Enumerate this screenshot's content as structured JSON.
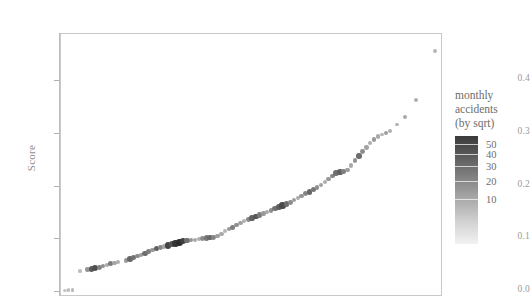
{
  "chart_data": {
    "type": "scatter",
    "title": "",
    "xlabel": "",
    "ylabel": "Score",
    "xlim": [
      0,
      100
    ],
    "ylim": [
      -0.01,
      0.49
    ],
    "grid": false,
    "x_tick_labels": [],
    "y_ticks": [
      0.0,
      0.1,
      0.2,
      0.3,
      0.4
    ],
    "y_tick_labels": [
      "0.0",
      "0.1",
      "0.2",
      "0.3",
      "0.4"
    ],
    "legend": {
      "position": "right",
      "title_lines": [
        "monthly",
        "accidents",
        "(by sqrt)"
      ],
      "colorbar_ticks": [
        50,
        40,
        30,
        20,
        10
      ],
      "colorbar_tick_labels": [
        "50",
        "40",
        "30",
        "20",
        "10"
      ],
      "scale": "sqrt",
      "high_color": "#333333",
      "low_color": "#f2f2f2"
    },
    "encoding": {
      "x": "rank index (unlabeled)",
      "y": "Score",
      "color": "monthly accidents",
      "size": "monthly accidents"
    },
    "points": [
      {
        "x": 1,
        "y": 0.002,
        "c": 2
      },
      {
        "x": 2,
        "y": 0.003,
        "c": 3
      },
      {
        "x": 3,
        "y": 0.004,
        "c": 4
      },
      {
        "x": 5,
        "y": 0.039,
        "c": 3
      },
      {
        "x": 7,
        "y": 0.042,
        "c": 10
      },
      {
        "x": 8,
        "y": 0.044,
        "c": 26
      },
      {
        "x": 9,
        "y": 0.046,
        "c": 30
      },
      {
        "x": 10,
        "y": 0.047,
        "c": 14
      },
      {
        "x": 11,
        "y": 0.049,
        "c": 11
      },
      {
        "x": 12,
        "y": 0.051,
        "c": 6
      },
      {
        "x": 13,
        "y": 0.053,
        "c": 16
      },
      {
        "x": 14,
        "y": 0.055,
        "c": 7
      },
      {
        "x": 15,
        "y": 0.056,
        "c": 5
      },
      {
        "x": 17,
        "y": 0.059,
        "c": 9
      },
      {
        "x": 18,
        "y": 0.062,
        "c": 22
      },
      {
        "x": 19,
        "y": 0.065,
        "c": 18
      },
      {
        "x": 20,
        "y": 0.068,
        "c": 12
      },
      {
        "x": 21,
        "y": 0.07,
        "c": 8
      },
      {
        "x": 22,
        "y": 0.073,
        "c": 20
      },
      {
        "x": 23,
        "y": 0.076,
        "c": 15
      },
      {
        "x": 24,
        "y": 0.079,
        "c": 9
      },
      {
        "x": 25,
        "y": 0.082,
        "c": 24
      },
      {
        "x": 26,
        "y": 0.084,
        "c": 13
      },
      {
        "x": 27,
        "y": 0.086,
        "c": 7
      },
      {
        "x": 28,
        "y": 0.088,
        "c": 34
      },
      {
        "x": 29,
        "y": 0.09,
        "c": 28
      },
      {
        "x": 30,
        "y": 0.092,
        "c": 40
      },
      {
        "x": 31,
        "y": 0.094,
        "c": 44
      },
      {
        "x": 32,
        "y": 0.096,
        "c": 36
      },
      {
        "x": 33,
        "y": 0.097,
        "c": 19
      },
      {
        "x": 34,
        "y": 0.098,
        "c": 10
      },
      {
        "x": 35,
        "y": 0.099,
        "c": 6
      },
      {
        "x": 36,
        "y": 0.1,
        "c": 5
      },
      {
        "x": 37,
        "y": 0.101,
        "c": 12
      },
      {
        "x": 38,
        "y": 0.102,
        "c": 17
      },
      {
        "x": 39,
        "y": 0.103,
        "c": 21
      },
      {
        "x": 40,
        "y": 0.104,
        "c": 14
      },
      {
        "x": 41,
        "y": 0.106,
        "c": 8
      },
      {
        "x": 42,
        "y": 0.11,
        "c": 6
      },
      {
        "x": 43,
        "y": 0.115,
        "c": 4
      },
      {
        "x": 44,
        "y": 0.119,
        "c": 9
      },
      {
        "x": 45,
        "y": 0.123,
        "c": 15
      },
      {
        "x": 46,
        "y": 0.127,
        "c": 11
      },
      {
        "x": 47,
        "y": 0.131,
        "c": 7
      },
      {
        "x": 48,
        "y": 0.134,
        "c": 5
      },
      {
        "x": 49,
        "y": 0.137,
        "c": 13
      },
      {
        "x": 50,
        "y": 0.14,
        "c": 23
      },
      {
        "x": 51,
        "y": 0.143,
        "c": 27
      },
      {
        "x": 52,
        "y": 0.146,
        "c": 16
      },
      {
        "x": 53,
        "y": 0.149,
        "c": 9
      },
      {
        "x": 54,
        "y": 0.152,
        "c": 6
      },
      {
        "x": 55,
        "y": 0.155,
        "c": 11
      },
      {
        "x": 56,
        "y": 0.158,
        "c": 18
      },
      {
        "x": 57,
        "y": 0.161,
        "c": 25
      },
      {
        "x": 58,
        "y": 0.164,
        "c": 31
      },
      {
        "x": 59,
        "y": 0.167,
        "c": 20
      },
      {
        "x": 60,
        "y": 0.17,
        "c": 12
      },
      {
        "x": 61,
        "y": 0.174,
        "c": 8
      },
      {
        "x": 62,
        "y": 0.178,
        "c": 6
      },
      {
        "x": 63,
        "y": 0.182,
        "c": 10
      },
      {
        "x": 64,
        "y": 0.186,
        "c": 14
      },
      {
        "x": 65,
        "y": 0.19,
        "c": 22
      },
      {
        "x": 66,
        "y": 0.194,
        "c": 17
      },
      {
        "x": 67,
        "y": 0.198,
        "c": 11
      },
      {
        "x": 68,
        "y": 0.203,
        "c": 7
      },
      {
        "x": 69,
        "y": 0.208,
        "c": 5
      },
      {
        "x": 70,
        "y": 0.214,
        "c": 9
      },
      {
        "x": 71,
        "y": 0.22,
        "c": 13
      },
      {
        "x": 72,
        "y": 0.226,
        "c": 19
      },
      {
        "x": 73,
        "y": 0.228,
        "c": 24
      },
      {
        "x": 74,
        "y": 0.229,
        "c": 15
      },
      {
        "x": 75,
        "y": 0.231,
        "c": 8
      },
      {
        "x": 76,
        "y": 0.24,
        "c": 6
      },
      {
        "x": 77,
        "y": 0.25,
        "c": 10
      },
      {
        "x": 78,
        "y": 0.258,
        "c": 20
      },
      {
        "x": 79,
        "y": 0.266,
        "c": 12
      },
      {
        "x": 80,
        "y": 0.274,
        "c": 7
      },
      {
        "x": 81,
        "y": 0.282,
        "c": 5
      },
      {
        "x": 82,
        "y": 0.289,
        "c": 9
      },
      {
        "x": 83,
        "y": 0.295,
        "c": 6
      },
      {
        "x": 84,
        "y": 0.299,
        "c": 4
      },
      {
        "x": 85,
        "y": 0.302,
        "c": 8
      },
      {
        "x": 86,
        "y": 0.306,
        "c": 5
      },
      {
        "x": 88,
        "y": 0.318,
        "c": 4
      },
      {
        "x": 90,
        "y": 0.332,
        "c": 6
      },
      {
        "x": 93,
        "y": 0.364,
        "c": 5
      },
      {
        "x": 98,
        "y": 0.458,
        "c": 4
      }
    ]
  }
}
